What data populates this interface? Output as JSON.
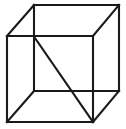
{
  "figure": {
    "name": "wireframe-cube",
    "background_color": "#ffffff",
    "line_color": "#1a1a1a",
    "line_width": 2.1,
    "canvas": {
      "width": 126,
      "height": 129
    },
    "vertices": {
      "front_top_left": {
        "x": 7,
        "y": 36
      },
      "front_top_right": {
        "x": 93,
        "y": 36
      },
      "front_bottom_right": {
        "x": 93,
        "y": 122
      },
      "front_bottom_left": {
        "x": 7,
        "y": 122
      },
      "back_top_left": {
        "x": 34,
        "y": 5
      },
      "back_top_right": {
        "x": 119,
        "y": 5
      },
      "back_bottom_right": {
        "x": 119,
        "y": 91
      },
      "back_bottom_left": {
        "x": 34,
        "y": 91
      }
    },
    "edges": [
      {
        "name": "front-top-edge",
        "points": "7,36 93,36"
      },
      {
        "name": "front-right-edge",
        "points": "93,36 93,122"
      },
      {
        "name": "front-bottom-edge",
        "points": "93,122 7,122"
      },
      {
        "name": "front-left-edge",
        "points": "7,122 7,36"
      },
      {
        "name": "back-top-edge",
        "points": "34,5 119,5"
      },
      {
        "name": "back-right-edge",
        "points": "119,5 119,91"
      },
      {
        "name": "back-bottom-edge",
        "points": "119,91 34,91"
      },
      {
        "name": "back-left-edge",
        "points": "34,91 34,5"
      },
      {
        "name": "connector-top-left",
        "points": "7,36 34,5"
      },
      {
        "name": "connector-top-right",
        "points": "93,36 119,5"
      },
      {
        "name": "connector-bottom-right",
        "points": "93,122 119,91"
      },
      {
        "name": "connector-bottom-left",
        "points": "7,122 34,91"
      }
    ],
    "diagonal": {
      "name": "face-diagonal",
      "points": "35,38 93,122",
      "from": "back_top_left_projection",
      "to": "front_bottom_right"
    }
  }
}
